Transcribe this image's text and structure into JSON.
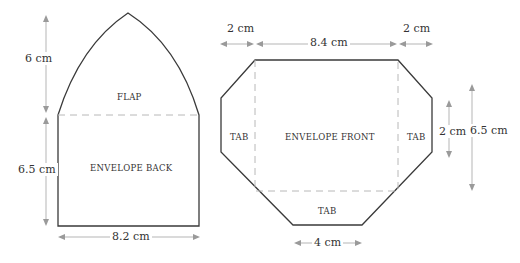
{
  "diagram": {
    "pieces": [
      {
        "id": "back",
        "regions": {
          "flap": "FLAP",
          "body": "ENVELOPE BACK"
        },
        "dimensions": {
          "flap_height": "6 cm",
          "body_height": "6.5 cm",
          "width": "8.2 cm"
        }
      },
      {
        "id": "front",
        "regions": {
          "left_tab": "TAB",
          "right_tab": "TAB",
          "body": "ENVELOPE FRONT",
          "bottom_tab": "TAB"
        },
        "dimensions": {
          "left_tab_width": "2 cm",
          "body_width": "8.4 cm",
          "right_tab_width": "2 cm",
          "side_tab_height": "2 cm",
          "body_height": "6.5 cm",
          "bottom_tab_width": "4 cm"
        }
      }
    ],
    "colors": {
      "outline": "#3a3a3a",
      "fold_line": "#b8b8b8",
      "dimension": "#b5b5b5"
    }
  }
}
